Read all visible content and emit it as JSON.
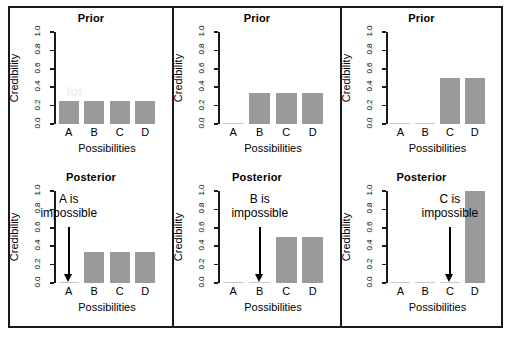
{
  "figure": {
    "y_axis_label": "Credibility",
    "x_axis_label": "Possibilities",
    "y_ticks": [
      "0.0",
      "0.2",
      "0.4",
      "0.6",
      "0.8",
      "1.0"
    ],
    "categories": [
      "A",
      "B",
      "C",
      "D"
    ],
    "bar_color": "#9a9a9a",
    "axis_color": "#1a1a1a",
    "ghost_text": "for"
  },
  "panels": [
    {
      "prior": {
        "title": "Prior"
      },
      "posterior": {
        "title": "Posterior",
        "annotation_line1": "A is",
        "annotation_line2": "impossible",
        "arrow_target": "A"
      }
    },
    {
      "prior": {
        "title": "Prior"
      },
      "posterior": {
        "title": "Posterior",
        "annotation_line1": "B is",
        "annotation_line2": "impossible",
        "arrow_target": "B"
      }
    },
    {
      "prior": {
        "title": "Prior"
      },
      "posterior": {
        "title": "Posterior",
        "annotation_line1": "C is",
        "annotation_line2": "impossible",
        "arrow_target": "C"
      }
    }
  ],
  "chart_data": [
    {
      "type": "bar",
      "title": "Prior",
      "panel": 1,
      "row": "prior",
      "categories": [
        "A",
        "B",
        "C",
        "D"
      ],
      "values": [
        0.25,
        0.25,
        0.25,
        0.25
      ],
      "xlabel": "Possibilities",
      "ylabel": "Credibility",
      "ylim": [
        0,
        1
      ],
      "yticks": [
        0.0,
        0.2,
        0.4,
        0.6,
        0.8,
        1.0
      ],
      "grid": false,
      "legend": "none"
    },
    {
      "type": "bar",
      "title": "Prior",
      "panel": 2,
      "row": "prior",
      "categories": [
        "A",
        "B",
        "C",
        "D"
      ],
      "values": [
        0.0,
        0.333,
        0.333,
        0.333
      ],
      "xlabel": "Possibilities",
      "ylabel": "Credibility",
      "ylim": [
        0,
        1
      ],
      "yticks": [
        0.0,
        0.2,
        0.4,
        0.6,
        0.8,
        1.0
      ],
      "grid": false,
      "legend": "none"
    },
    {
      "type": "bar",
      "title": "Prior",
      "panel": 3,
      "row": "prior",
      "categories": [
        "A",
        "B",
        "C",
        "D"
      ],
      "values": [
        0.0,
        0.0,
        0.5,
        0.5
      ],
      "xlabel": "Possibilities",
      "ylabel": "Credibility",
      "ylim": [
        0,
        1
      ],
      "yticks": [
        0.0,
        0.2,
        0.4,
        0.6,
        0.8,
        1.0
      ],
      "grid": false,
      "legend": "none"
    },
    {
      "type": "bar",
      "title": "Posterior",
      "panel": 1,
      "row": "posterior",
      "categories": [
        "A",
        "B",
        "C",
        "D"
      ],
      "values": [
        0.0,
        0.333,
        0.333,
        0.333
      ],
      "xlabel": "Possibilities",
      "ylabel": "Credibility",
      "ylim": [
        0,
        1
      ],
      "yticks": [
        0.0,
        0.2,
        0.4,
        0.6,
        0.8,
        1.0
      ],
      "grid": false,
      "legend": "none",
      "annotation": "A is impossible"
    },
    {
      "type": "bar",
      "title": "Posterior",
      "panel": 2,
      "row": "posterior",
      "categories": [
        "A",
        "B",
        "C",
        "D"
      ],
      "values": [
        0.0,
        0.0,
        0.5,
        0.5
      ],
      "xlabel": "Possibilities",
      "ylabel": "Credibility",
      "ylim": [
        0,
        1
      ],
      "yticks": [
        0.0,
        0.2,
        0.4,
        0.6,
        0.8,
        1.0
      ],
      "grid": false,
      "legend": "none",
      "annotation": "B is impossible"
    },
    {
      "type": "bar",
      "title": "Posterior",
      "panel": 3,
      "row": "posterior",
      "categories": [
        "A",
        "B",
        "C",
        "D"
      ],
      "values": [
        0.0,
        0.0,
        0.0,
        1.0
      ],
      "xlabel": "Possibilities",
      "ylabel": "Credibility",
      "ylim": [
        0,
        1
      ],
      "yticks": [
        0.0,
        0.2,
        0.4,
        0.6,
        0.8,
        1.0
      ],
      "grid": false,
      "legend": "none",
      "annotation": "C is impossible"
    }
  ]
}
